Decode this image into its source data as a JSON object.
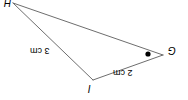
{
  "figure": {
    "type": "triangle-diagram",
    "orientation_note": "rotated-180",
    "width": 188,
    "height": 100,
    "background_color": "#ffffff",
    "stroke_color": "#6e6e6e",
    "marker_color": "#000000",
    "vertices": [
      {
        "id": "H",
        "label": "H",
        "x": 13,
        "y": 3,
        "clipped": true
      },
      {
        "id": "G",
        "label": "G",
        "x": 163,
        "y": 55,
        "clipped": false
      },
      {
        "id": "I",
        "label": "I",
        "x": 93,
        "y": 80,
        "clipped": false
      }
    ],
    "sides": [
      {
        "id": "HG",
        "from": "H",
        "to": "G",
        "label": ""
      },
      {
        "id": "HI",
        "from": "H",
        "to": "I",
        "label": "3 cm"
      },
      {
        "id": "IG",
        "from": "I",
        "to": "G",
        "label": "2 cm"
      }
    ],
    "markers": [
      {
        "id": "angle-dot-g",
        "name": "angle-marker-dot",
        "x": 148,
        "y": 54,
        "radius": 2.6
      }
    ],
    "labels": {
      "vertex_h": "H",
      "vertex_g": "G",
      "vertex_i": "I",
      "side_hi": "3 cm",
      "side_ig": "2 cm"
    }
  }
}
